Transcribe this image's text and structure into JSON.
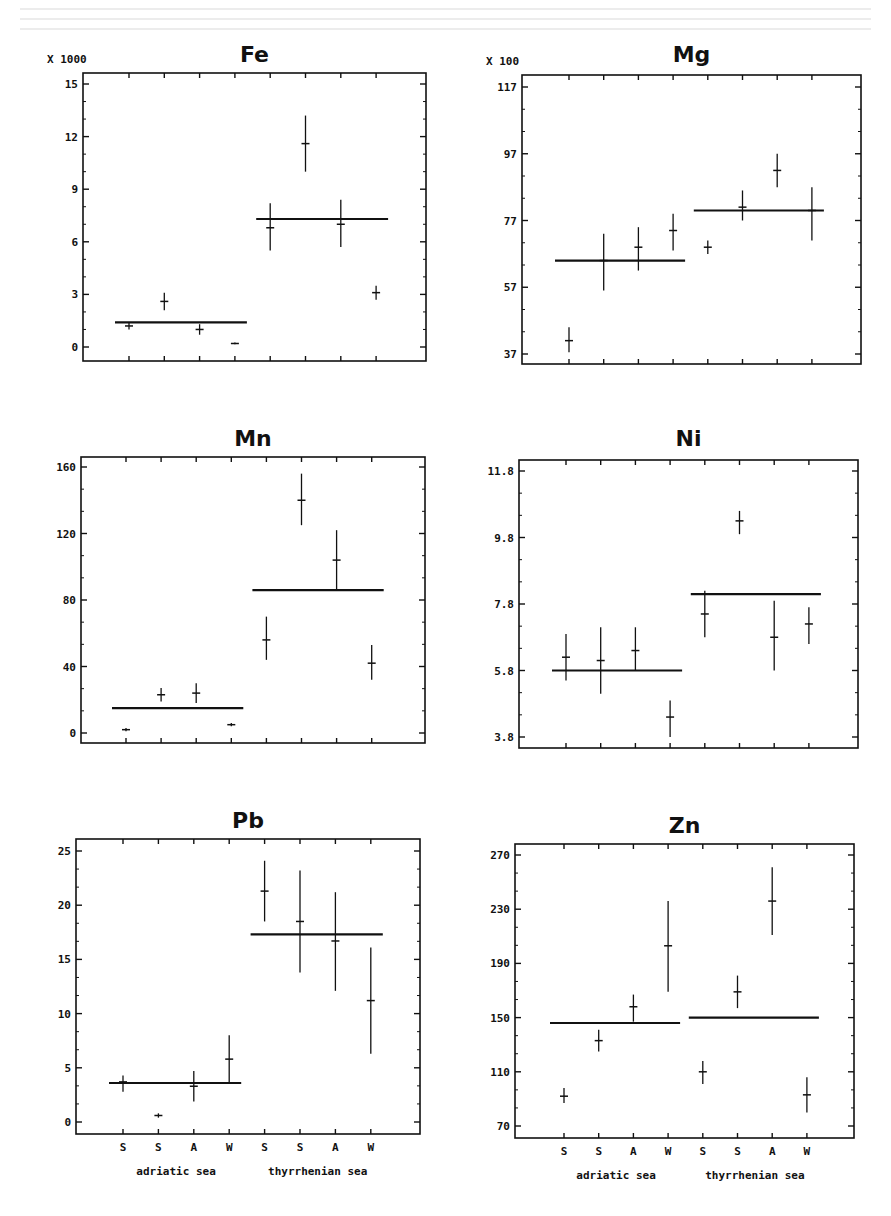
{
  "figure": {
    "categories": [
      "S",
      "S",
      "A",
      "W",
      "S",
      "S",
      "A",
      "W"
    ],
    "groups": [
      "adriatic sea",
      "thyrrhenian sea"
    ]
  },
  "chart_data": [
    {
      "type": "scatter",
      "title": "Fe",
      "multiplier_label": "X 1000",
      "ylim": [
        0,
        15
      ],
      "yticks": [
        0,
        3,
        6,
        9,
        12,
        15
      ],
      "ytick_labels": [
        "0",
        "3",
        "6",
        "9",
        "12",
        "15"
      ],
      "categories": [
        "S",
        "S",
        "A",
        "W",
        "S",
        "S",
        "A",
        "W"
      ],
      "values": [
        1.2,
        2.6,
        1.0,
        0.2,
        6.8,
        11.6,
        7.0,
        3.1
      ],
      "err_low": [
        1.0,
        2.1,
        0.7,
        0.15,
        5.5,
        10.0,
        5.7,
        2.7
      ],
      "err_high": [
        1.4,
        3.1,
        1.3,
        0.25,
        8.2,
        13.2,
        8.4,
        3.5
      ],
      "group_means": [
        1.4,
        7.3
      ],
      "show_x_labels": false
    },
    {
      "type": "scatter",
      "title": "Mg",
      "multiplier_label": "X 100",
      "ylim": [
        37,
        117
      ],
      "yticks": [
        37,
        57,
        77,
        97,
        117
      ],
      "ytick_labels": [
        "37",
        "57",
        "77",
        "97",
        "117"
      ],
      "categories": [
        "S",
        "S",
        "A",
        "W",
        "S",
        "S",
        "A",
        "W"
      ],
      "values": [
        41,
        65,
        69,
        74,
        69,
        81,
        92,
        80
      ],
      "err_low": [
        37.5,
        56,
        62,
        68,
        67,
        77,
        87,
        71
      ],
      "err_high": [
        45,
        73,
        75,
        79,
        71,
        86,
        97,
        87
      ],
      "group_means": [
        65,
        80
      ],
      "show_x_labels": false
    },
    {
      "type": "scatter",
      "title": "Mn",
      "multiplier_label": "",
      "ylim": [
        0,
        160
      ],
      "yticks": [
        0,
        40,
        80,
        120,
        160
      ],
      "ytick_labels": [
        "0",
        "40",
        "80",
        "120",
        "160"
      ],
      "categories": [
        "S",
        "S",
        "A",
        "W",
        "S",
        "S",
        "A",
        "W"
      ],
      "values": [
        2,
        23,
        24,
        5,
        56,
        140,
        104,
        42
      ],
      "err_low": [
        1,
        19,
        18,
        4,
        44,
        125,
        86,
        32
      ],
      "err_high": [
        3,
        27,
        30,
        6,
        70,
        156,
        122,
        53
      ],
      "group_means": [
        15,
        86
      ],
      "show_x_labels": false
    },
    {
      "type": "scatter",
      "title": "Ni",
      "multiplier_label": "",
      "ylim": [
        3.8,
        11.8
      ],
      "yticks": [
        3.8,
        5.8,
        7.8,
        9.8,
        11.8
      ],
      "ytick_labels": [
        "3.8",
        "5.8",
        "7.8",
        "9.8",
        "11.8"
      ],
      "categories": [
        "S",
        "S",
        "A",
        "W",
        "S",
        "S",
        "A",
        "W"
      ],
      "values": [
        6.2,
        6.1,
        6.4,
        4.4,
        7.5,
        10.3,
        6.8,
        7.2
      ],
      "err_low": [
        5.5,
        5.1,
        5.8,
        3.8,
        6.8,
        9.9,
        5.8,
        6.6
      ],
      "err_high": [
        6.9,
        7.1,
        7.1,
        4.9,
        8.2,
        10.6,
        7.9,
        7.7
      ],
      "group_means": [
        5.8,
        8.1
      ],
      "show_x_labels": false
    },
    {
      "type": "scatter",
      "title": "Pb",
      "multiplier_label": "",
      "ylim": [
        0,
        25
      ],
      "yticks": [
        0,
        5,
        10,
        15,
        20,
        25
      ],
      "ytick_labels": [
        "0",
        "5",
        "10",
        "15",
        "20",
        "25"
      ],
      "categories": [
        "S",
        "S",
        "A",
        "W",
        "S",
        "S",
        "A",
        "W"
      ],
      "values": [
        3.7,
        0.6,
        3.3,
        5.8,
        21.3,
        18.5,
        16.7,
        11.2
      ],
      "err_low": [
        2.8,
        0.4,
        1.9,
        3.6,
        18.5,
        13.8,
        12.1,
        6.3
      ],
      "err_high": [
        4.3,
        0.8,
        4.7,
        8.0,
        24.1,
        23.2,
        21.2,
        16.1
      ],
      "group_means": [
        3.6,
        17.3
      ],
      "show_x_labels": true
    },
    {
      "type": "scatter",
      "title": "Zn",
      "multiplier_label": "",
      "ylim": [
        70,
        270
      ],
      "yticks": [
        70,
        110,
        150,
        190,
        230,
        270
      ],
      "ytick_labels": [
        "70",
        "110",
        "150",
        "190",
        "230",
        "270"
      ],
      "categories": [
        "S",
        "S",
        "A",
        "W",
        "S",
        "S",
        "A",
        "W"
      ],
      "values": [
        92,
        133,
        158,
        203,
        110,
        169,
        236,
        93
      ],
      "err_low": [
        87,
        125,
        147,
        169,
        101,
        157,
        211,
        80
      ],
      "err_high": [
        98,
        141,
        167,
        236,
        118,
        181,
        261,
        106
      ],
      "group_means": [
        146,
        150
      ],
      "show_x_labels": true
    }
  ]
}
